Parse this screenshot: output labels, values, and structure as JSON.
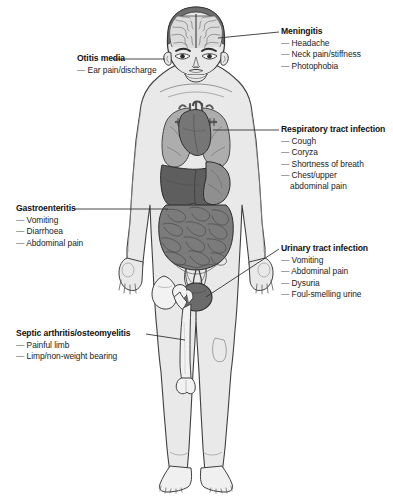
{
  "diagram": {
    "figure_description": "Anterior view of a child's body showing brain, lungs, heart, liver, stomach, intestines, bladder and skeletal structures",
    "colors": {
      "body_fill": "#e9e9e9",
      "outline": "#3f3f3f",
      "lung": "#a8a8a8",
      "heart": "#767676",
      "liver": "#5e5e5e",
      "stomach": "#8f8f8f",
      "intestine": "#7b7b7b",
      "bladder": "#6b6b6b",
      "brain": "#d5d5d5",
      "bone": "#f2f2f2",
      "leader_line": "#333333",
      "text": "#1a1a1a"
    }
  },
  "labels": [
    {
      "id": "meningitis",
      "title": "Meningitis",
      "side": "right",
      "symptoms": [
        "Headache",
        "Neck pain/stiffness",
        "Photophobia"
      ],
      "anchor": "head"
    },
    {
      "id": "otitis-media",
      "title": "Otitis media",
      "side": "left",
      "symptoms": [
        "Ear pain/discharge"
      ],
      "anchor": "ear"
    },
    {
      "id": "respiratory-tract-infection",
      "title": "Respiratory tract infection",
      "side": "right",
      "symptoms": [
        "Cough",
        "Coryza",
        "Shortness of breath",
        "Chest/upper"
      ],
      "continuation": "abdominal pain",
      "anchor": "chest"
    },
    {
      "id": "gastroenteritis",
      "title": "Gastroenteritis",
      "side": "left",
      "symptoms": [
        "Vomiting",
        "Diarrhoea",
        "Abdominal pain"
      ],
      "anchor": "abdomen"
    },
    {
      "id": "urinary-tract-infection",
      "title": "Urinary tract infection",
      "side": "right",
      "symptoms": [
        "Vomiting",
        "Abdominal pain",
        "Dysuria",
        "Foul-smelling urine"
      ],
      "anchor": "bladder"
    },
    {
      "id": "septic-arthritis-osteomyelitis",
      "title": "Septic arthritis/osteomyelitis",
      "side": "left",
      "symptoms": [
        "Painful limb",
        "Limp/non-weight bearing"
      ],
      "anchor": "femur"
    }
  ],
  "dash": "—"
}
